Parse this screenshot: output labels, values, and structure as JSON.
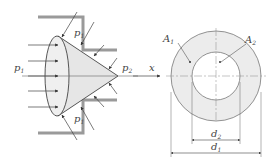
{
  "left_figure": {
    "description": "Cone valve seated in a stepped bore with pressure arrows",
    "labels": {
      "p1_left": {
        "base": "p",
        "sub": "1"
      },
      "p1_top": {
        "base": "p",
        "sub": "1"
      },
      "p1_bottom": {
        "base": "p",
        "sub": "1"
      },
      "p2": {
        "base": "p",
        "sub": "2"
      }
    }
  },
  "axis": {
    "label": "x"
  },
  "right_figure": {
    "description": "Annular cross-section",
    "labels": {
      "A1": {
        "base": "A",
        "sub": "1"
      },
      "A2": {
        "base": "A",
        "sub": "2"
      },
      "d2": {
        "base": "d",
        "sub": "2"
      },
      "d1": {
        "base": "d",
        "sub": "1"
      }
    }
  },
  "colors": {
    "line": "#444444",
    "wall": "#9a9a9a",
    "fill": "#e6e6e6",
    "ring": "#ececec"
  }
}
